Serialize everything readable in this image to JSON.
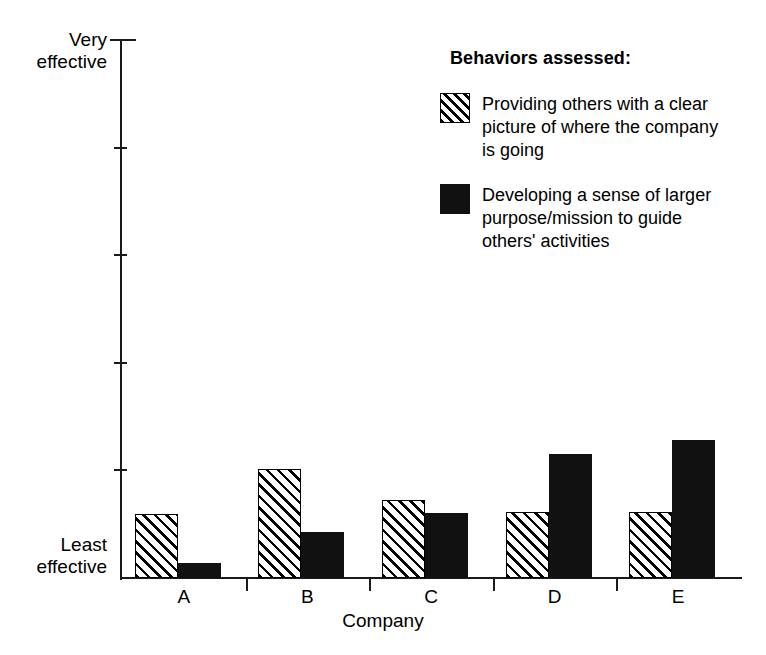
{
  "chart_data": {
    "type": "bar",
    "title": "",
    "xlabel": "Company",
    "ylabel": "",
    "categories": [
      "A",
      "B",
      "C",
      "D",
      "E"
    ],
    "series": [
      {
        "name": "Providing others with a clear picture of where the company is going",
        "style": "hatched",
        "values": [
          0.119,
          0.203,
          0.145,
          0.123,
          0.123
        ]
      },
      {
        "name": "Developing a sense of larger purpose/mission to guide others' activities",
        "style": "solid",
        "values": [
          0.028,
          0.086,
          0.121,
          0.23,
          0.257
        ]
      }
    ],
    "ylim": [
      0,
      1
    ],
    "y_axis_low_label": "Least\neffective",
    "y_axis_high_label": "Very\neffective",
    "y_tick_count": 6,
    "grid": false,
    "legend_position": "top-right"
  },
  "axis": {
    "y_top_label_line1": "Very",
    "y_top_label_line2": "effective",
    "y_bottom_label_line1": "Least",
    "y_bottom_label_line2": "effective",
    "x_title": "Company",
    "categories": [
      "A",
      "B",
      "C",
      "D",
      "E"
    ]
  },
  "legend": {
    "title": "Behaviors assessed:",
    "entries": [
      {
        "swatch": "hatched-swatch",
        "text": "Providing others with a clear picture of where the company is going"
      },
      {
        "swatch": "solid-swatch",
        "text": "Developing a sense of larger purpose/mission to guide others' activities"
      }
    ]
  },
  "colors": {
    "axis": "#1a1a1a",
    "bar_solid": "#111111",
    "bar_hatch": "#000000",
    "background": "#ffffff"
  }
}
